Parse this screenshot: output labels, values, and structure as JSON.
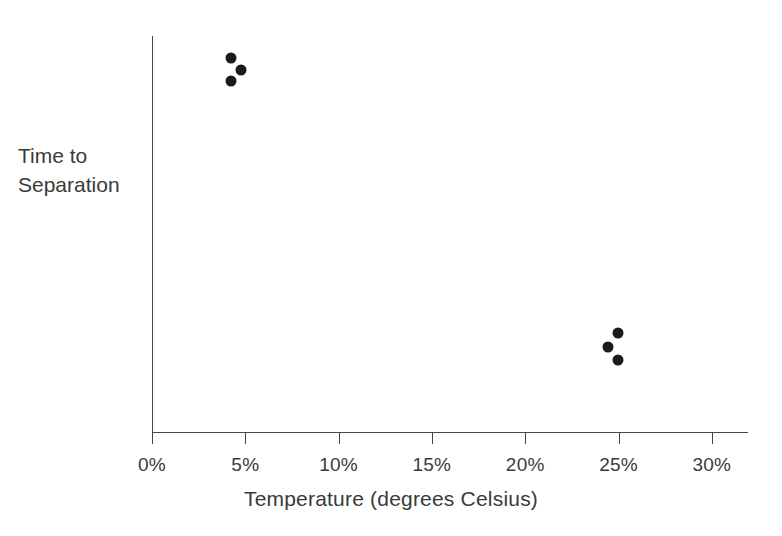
{
  "chart_data": {
    "type": "scatter",
    "title": "",
    "xlabel": "Temperature (degrees Celsius)",
    "ylabel_lines": [
      "Time to",
      "Separation"
    ],
    "ylabel": "Time to Separation",
    "x_tick_labels": [
      "0%",
      "5%",
      "10%",
      "15%",
      "20%",
      "25%",
      "30%"
    ],
    "x_tick_values": [
      0,
      5,
      10,
      15,
      20,
      25,
      30
    ],
    "y_tick_labels": [],
    "xlim": [
      0,
      32
    ],
    "ylim": [
      0,
      100
    ],
    "grid": false,
    "legend": false,
    "legend_position": "none",
    "marker": {
      "shape": "circle",
      "color": "#1a1a1a",
      "diameter_px": 11
    },
    "axis_color": "#464646",
    "text_color": "#3a3a3a",
    "background": "#ffffff",
    "series": [
      {
        "name": "observations",
        "points": [
          {
            "x": 4.2,
            "y": 94,
            "px": 231,
            "py": 58
          },
          {
            "x": 4.8,
            "y": 91,
            "px": 241,
            "py": 70
          },
          {
            "x": 4.2,
            "y": 88,
            "px": 231,
            "py": 81
          },
          {
            "x": 25.0,
            "y": 25,
            "px": 618,
            "py": 333
          },
          {
            "x": 24.5,
            "y": 21,
            "px": 608,
            "py": 347
          },
          {
            "x": 25.0,
            "y": 18,
            "px": 618,
            "py": 360
          }
        ]
      }
    ],
    "clusters": [
      {
        "name": "low-temperature-cluster",
        "count": 3,
        "x_center": 4.4,
        "y_level": "high"
      },
      {
        "name": "high-temperature-cluster",
        "count": 3,
        "x_center": 24.8,
        "y_level": "low"
      }
    ],
    "geometry": {
      "x_axis_y": 432,
      "y_axis_x": 152,
      "y_axis_top": 36,
      "x_axis_right": 748,
      "x_origin_px": 152,
      "px_per_5pct": 93.3,
      "tick_length": 11
    }
  }
}
